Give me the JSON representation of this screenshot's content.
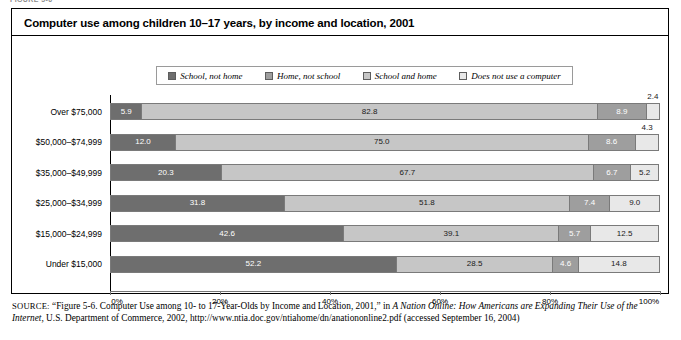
{
  "figure_stub": "FIGURE 5-6",
  "title": "Computer use among children 10–17 years, by income and location, 2001",
  "legend": {
    "items": [
      {
        "label": "School, not home",
        "color": "#6e6e6e"
      },
      {
        "label": "Home, not school",
        "color": "#9e9e9e"
      },
      {
        "label": "School and home",
        "color": "#c6c6c6"
      },
      {
        "label": "Does not use a computer",
        "color": "#e8e8e8"
      }
    ]
  },
  "source": {
    "prefix": "SOURCE:",
    "text_1": " “Figure 5-6. Computer Use among 10- to 17-Year-Olds by Income and Location, 2001,” in ",
    "italic_1": "A Nation Online: How Americans are Expanding Their Use of the Internet,",
    "text_2": " U.S. Department of Commerce, 2002, http://www.ntia.doc.gov/ntiahome/dn/anationonline2.pdf (accessed September 16, 2004)"
  },
  "chart_data": {
    "type": "bar",
    "orientation": "horizontal",
    "stacked": true,
    "stack_total": 100,
    "title": "Computer use among children 10–17 years, by income and location, 2001",
    "xlabel": "",
    "ylabel": "",
    "xlim": [
      0,
      100
    ],
    "xticks": [
      0,
      20,
      40,
      60,
      80,
      100
    ],
    "xtick_labels": [
      "0%",
      "20%",
      "40%",
      "60%",
      "80%",
      "100%"
    ],
    "grid": false,
    "legend_position": "top",
    "categories": [
      "Over $75,000",
      "$50,000–$74,999",
      "$35,000–$49,999",
      "$25,000–$34,999",
      "$15,000–$24,999",
      "Under $15,000"
    ],
    "series": [
      {
        "name": "School, not home",
        "color": "#6e6e6e",
        "values": [
          5.9,
          12.0,
          20.3,
          31.8,
          42.6,
          52.2
        ],
        "labels": [
          "5.9",
          "12.0",
          "20.3",
          "31.8",
          "42.6",
          "52.2"
        ],
        "label_style": [
          "on-dark",
          "on-dark",
          "on-dark",
          "on-dark",
          "on-dark",
          "on-dark"
        ]
      },
      {
        "name": "Home, not school",
        "color": "#c6c6c6",
        "values": [
          82.8,
          75.0,
          67.7,
          51.8,
          39.1,
          28.5
        ],
        "labels": [
          "82.8",
          "75.0",
          "67.7",
          "51.8",
          "39.1",
          "28.5"
        ],
        "label_style": [
          "on-light",
          "on-light",
          "on-light",
          "on-light",
          "on-light",
          "on-light"
        ]
      },
      {
        "name": "School and home",
        "color": "#9e9e9e",
        "values": [
          8.9,
          8.6,
          6.7,
          7.4,
          5.7,
          4.6
        ],
        "labels": [
          "8.9",
          "8.6",
          "6.7",
          "7.4",
          "5.7",
          "4.6"
        ],
        "label_style": [
          "on-dark",
          "on-dark",
          "on-dark",
          "on-dark",
          "on-dark",
          "on-dark"
        ]
      },
      {
        "name": "Does not use a computer",
        "color": "#e8e8e8",
        "values": [
          2.4,
          4.3,
          5.2,
          9.0,
          12.5,
          14.8
        ],
        "labels": [
          "2.4",
          "4.3",
          "5.2",
          "9.0",
          "12.5",
          "14.8"
        ],
        "label_style": [
          "above",
          "above",
          "on-light",
          "on-light",
          "on-light",
          "on-light"
        ]
      }
    ]
  }
}
